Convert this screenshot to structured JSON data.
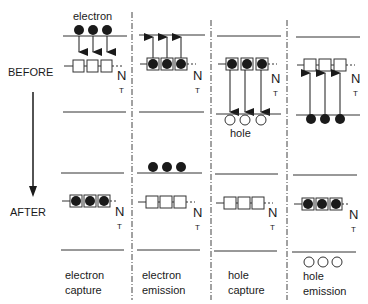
{
  "figure": {
    "side_labels": {
      "before": "BEFORE",
      "after": "AFTER"
    },
    "annotations": {
      "electron": "electron",
      "hole": "hole"
    },
    "trap_label": {
      "main": "N",
      "sub": "T"
    },
    "columns": [
      {
        "id": "electron-capture",
        "caption_line1": "electron",
        "caption_line2": "capture"
      },
      {
        "id": "electron-emission",
        "caption_line1": "electron",
        "caption_line2": "emission"
      },
      {
        "id": "hole-capture",
        "caption_line1": "hole",
        "caption_line2": "capture"
      },
      {
        "id": "hole-emission",
        "caption_line1": "hole",
        "caption_line2": "emission"
      }
    ],
    "colors": {
      "ink": "#1a1a1a",
      "background": "#ffffff"
    }
  }
}
